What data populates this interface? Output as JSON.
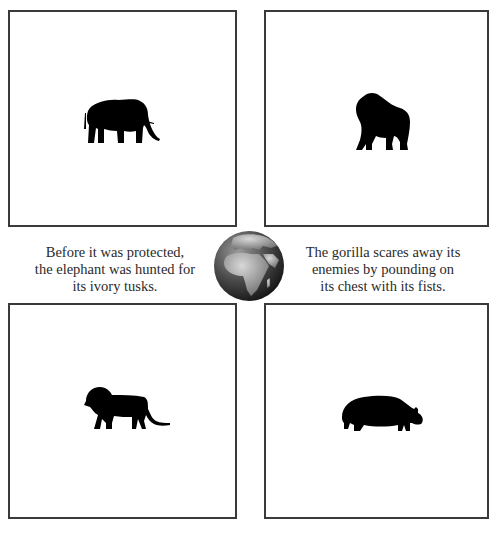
{
  "cards": [
    {
      "name": "elephant",
      "icon": "elephant-icon"
    },
    {
      "name": "gorilla",
      "icon": "gorilla-icon"
    },
    {
      "name": "lion",
      "icon": "lion-icon"
    },
    {
      "name": "hippopotamus",
      "icon": "hippo-icon"
    }
  ],
  "captions": {
    "left": {
      "line1": "Before it was protected,",
      "line2": "the elephant was hunted for",
      "line3": "its ivory tusks."
    },
    "right": {
      "line1": "The gorilla scares away its",
      "line2": "enemies by pounding on",
      "line3": "its chest with its fists."
    }
  },
  "center_image": {
    "icon": "globe-africa-icon"
  },
  "colors": {
    "border": "#3a3a3a",
    "silhouette": "#000000",
    "text": "#2a2a2a"
  }
}
